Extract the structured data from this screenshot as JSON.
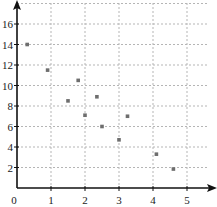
{
  "chart_data": {
    "type": "scatter",
    "title": "",
    "xlabel": "",
    "ylabel": "",
    "xlim": [
      0,
      5.5
    ],
    "ylim": [
      0,
      18
    ],
    "grid": true,
    "legend": null,
    "x_ticks": [
      "0",
      "1",
      "2",
      "3",
      "4",
      "5"
    ],
    "y_ticks": [
      "2",
      "4",
      "6",
      "8",
      "10",
      "12",
      "14",
      "16"
    ],
    "series": [
      {
        "name": "points",
        "points": [
          {
            "x": 0.3,
            "y": 14.0
          },
          {
            "x": 0.9,
            "y": 11.5
          },
          {
            "x": 1.5,
            "y": 8.5
          },
          {
            "x": 1.8,
            "y": 10.5
          },
          {
            "x": 2.0,
            "y": 7.1
          },
          {
            "x": 2.35,
            "y": 8.9
          },
          {
            "x": 2.5,
            "y": 6.0
          },
          {
            "x": 3.0,
            "y": 4.7
          },
          {
            "x": 3.25,
            "y": 7.0
          },
          {
            "x": 4.1,
            "y": 3.3
          },
          {
            "x": 4.6,
            "y": 1.85
          }
        ]
      }
    ]
  },
  "colors": {
    "axis": "#111111",
    "grid": "#b5b5b5",
    "point": "#6e6e6e",
    "text": "#1a1a1a"
  }
}
